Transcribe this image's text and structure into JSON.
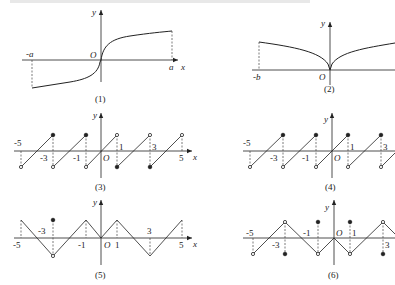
{
  "figure": {
    "header_fragment": "",
    "panels": [
      {
        "id": 1,
        "caption": "(1)",
        "axis_labels": {
          "x": "x",
          "y": "y",
          "origin": "O"
        },
        "tick_labels": [
          "-a",
          "a"
        ],
        "description": "Odd increasing curve on [-a, a], vertical tangent at origin"
      },
      {
        "id": 2,
        "caption": "(2)",
        "axis_labels": {
          "y": "y",
          "origin": "O"
        },
        "tick_labels": [
          "-b"
        ],
        "description": "Even-like cusp curve with minimum 0 at origin, starting at x=-b"
      },
      {
        "id": 3,
        "caption": "(3)",
        "axis_labels": {
          "x": "x",
          "y": "y",
          "origin": "O"
        },
        "tick_labels": [
          "-5",
          "-3",
          "-1",
          "1",
          "3",
          "5"
        ],
        "description": "Sawtooth with period 2; closed dots at top for x=-3,-1 and bottom for x=1,3"
      },
      {
        "id": 4,
        "caption": "(4)",
        "axis_labels": {
          "y": "y",
          "origin": "O"
        },
        "tick_labels": [
          "-5",
          "-3",
          "-1",
          "1",
          "3"
        ],
        "description": "Sawtooth with period 2; closed dots at top, open circles at bottom"
      },
      {
        "id": 5,
        "caption": "(5)",
        "axis_labels": {
          "x": "x",
          "y": "y",
          "origin": "O"
        },
        "tick_labels": [
          "-5",
          "-3",
          "-1",
          "1",
          "3",
          "5"
        ],
        "description": "Triangle wave with period 4; peaks at odd x except -3 (open valley with isolated closed dot above)"
      },
      {
        "id": 6,
        "caption": "(6)",
        "axis_labels": {
          "y": "y",
          "origin": "O"
        },
        "tick_labels": [
          "-5",
          "-3",
          "-1",
          "1",
          "3"
        ],
        "description": "Triangle wave with open endpoints and isolated closed dots"
      }
    ]
  },
  "colors": {
    "stroke": "#222222",
    "dash": "#444444",
    "background": "#ffffff"
  }
}
